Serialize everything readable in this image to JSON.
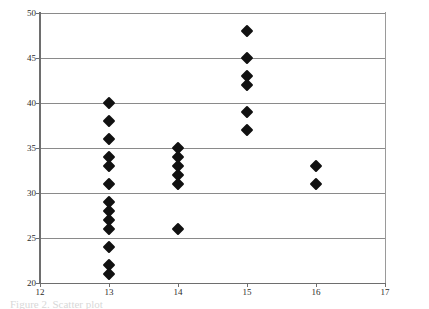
{
  "figure": {
    "caption_fragment": "Figure 2. Scatter plot"
  },
  "axes": {
    "y_ticks": [
      20,
      25,
      30,
      35,
      40,
      45,
      50
    ],
    "x_ticks": [
      12,
      13,
      14,
      15,
      16,
      17
    ],
    "x_min": 12,
    "x_max": 17,
    "y_min": 20,
    "y_max": 50,
    "grid_color": "#8a8a8a",
    "axis_color": "#6e6e6e",
    "marker_color": "#111111"
  },
  "chart_data": {
    "type": "scatter",
    "title": "",
    "xlabel": "",
    "ylabel": "",
    "xlim": [
      12,
      17
    ],
    "ylim": [
      20,
      50
    ],
    "xticks": [
      12,
      13,
      14,
      15,
      16,
      17
    ],
    "yticks": [
      20,
      25,
      30,
      35,
      40,
      45,
      50
    ],
    "grid": true,
    "legend": null,
    "marker": "filled-diamond",
    "series": [
      {
        "name": "observations",
        "points": [
          [
            13,
            40
          ],
          [
            13,
            38
          ],
          [
            13,
            36
          ],
          [
            13,
            34
          ],
          [
            13,
            33
          ],
          [
            13,
            31
          ],
          [
            13,
            29
          ],
          [
            13,
            28
          ],
          [
            13,
            27
          ],
          [
            13,
            26
          ],
          [
            13,
            24
          ],
          [
            13,
            22
          ],
          [
            13,
            21
          ],
          [
            14,
            35
          ],
          [
            14,
            34
          ],
          [
            14,
            33
          ],
          [
            14,
            32
          ],
          [
            14,
            31
          ],
          [
            14,
            26
          ],
          [
            15,
            48
          ],
          [
            15,
            45
          ],
          [
            15,
            43
          ],
          [
            15,
            42
          ],
          [
            15,
            39
          ],
          [
            15,
            37
          ],
          [
            16,
            33
          ],
          [
            16,
            31
          ]
        ]
      }
    ]
  }
}
